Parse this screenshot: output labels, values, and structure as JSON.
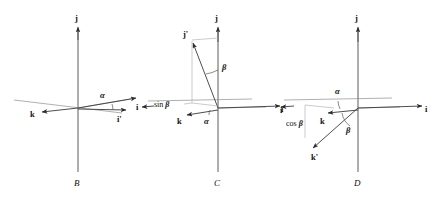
{
  "figure": {
    "background_color": "#ffffff",
    "ink_color": "#2b2b2b"
  },
  "panels": [
    {
      "id": "B",
      "caption": "B",
      "axis_labels": {
        "vertical": "j",
        "right": "i",
        "left_vector": "k"
      },
      "vectors": [
        {
          "name": "j",
          "label": "j"
        },
        {
          "name": "i",
          "label": "i"
        },
        {
          "name": "i-prime",
          "label": "i'"
        },
        {
          "name": "k",
          "label": "k"
        }
      ],
      "angles": [
        {
          "name": "alpha",
          "label": "α"
        }
      ],
      "projections": []
    },
    {
      "id": "C",
      "caption": "C",
      "axis_labels": {
        "vertical": "j",
        "right": "i",
        "left_vector": "k"
      },
      "vectors": [
        {
          "name": "j",
          "label": "j"
        },
        {
          "name": "j-prime",
          "label": "j'"
        },
        {
          "name": "i",
          "label": "i"
        },
        {
          "name": "k",
          "label": "k"
        }
      ],
      "angles": [
        {
          "name": "alpha",
          "label": "α"
        },
        {
          "name": "beta",
          "label": "β"
        }
      ],
      "projections": [
        {
          "name": "sin-beta",
          "prefix": "sin ",
          "symbol": "β"
        }
      ]
    },
    {
      "id": "D",
      "caption": "D",
      "axis_labels": {
        "vertical": "j",
        "right": "i",
        "left_vector": "i"
      },
      "vectors": [
        {
          "name": "j",
          "label": "j"
        },
        {
          "name": "i-right",
          "label": "i"
        },
        {
          "name": "i-left",
          "label": "i"
        },
        {
          "name": "k",
          "label": "k"
        },
        {
          "name": "k-prime",
          "label": "k'"
        }
      ],
      "angles": [
        {
          "name": "alpha",
          "label": "α"
        },
        {
          "name": "beta",
          "label": "β"
        }
      ],
      "projections": [
        {
          "name": "cos-beta",
          "prefix": "cos ",
          "symbol": "β"
        }
      ]
    }
  ]
}
